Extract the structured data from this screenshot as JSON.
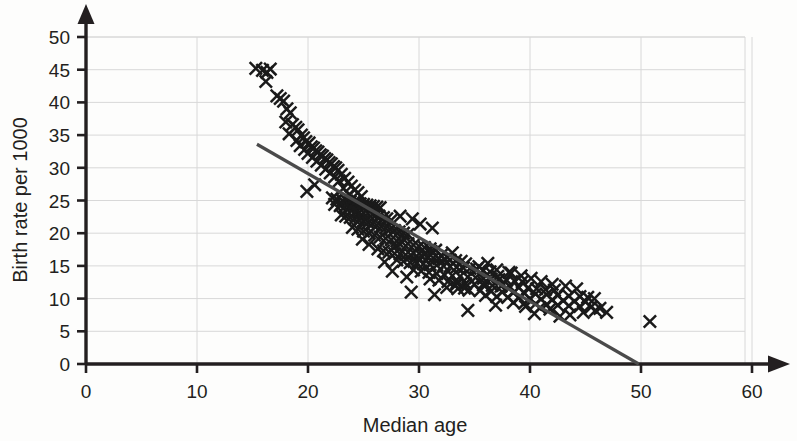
{
  "chart_data": {
    "type": "scatter",
    "title": "",
    "xlabel": "Median age",
    "ylabel": "Birth rate per 1000",
    "xlim": [
      0,
      60
    ],
    "ylim": [
      0,
      50
    ],
    "xticks": [
      0,
      10,
      20,
      30,
      40,
      50,
      60
    ],
    "yticks": [
      0,
      5,
      10,
      15,
      20,
      25,
      30,
      35,
      40,
      45,
      50
    ],
    "grid": "both",
    "grid_color": "#d8d8d8",
    "marker": "x-cross",
    "marker_color": "#1a1a1a",
    "axis_color": "#231f20",
    "background": "#fdfdfc",
    "legend": "none",
    "trend_line": {
      "label": "line of best fit",
      "color": "#4a4a4a",
      "x_start": 15.4,
      "y_start": 33.6,
      "x_end": 49.8,
      "y_end": 0.0
    },
    "points": [
      [
        15.3,
        45.2
      ],
      [
        15.9,
        44.9
      ],
      [
        16.3,
        44.6
      ],
      [
        16.6,
        45.1
      ],
      [
        16.2,
        43.2
      ],
      [
        17.2,
        41.0
      ],
      [
        17.5,
        40.6
      ],
      [
        17.8,
        40.2
      ],
      [
        18.1,
        39.0
      ],
      [
        18.4,
        38.4
      ],
      [
        18.0,
        37.0
      ],
      [
        18.6,
        36.6
      ],
      [
        18.9,
        36.2
      ],
      [
        19.1,
        35.8
      ],
      [
        18.3,
        35.2
      ],
      [
        19.4,
        35.0
      ],
      [
        19.6,
        34.6
      ],
      [
        19.0,
        34.2
      ],
      [
        19.8,
        34.0
      ],
      [
        20.1,
        33.8
      ],
      [
        19.3,
        33.4
      ],
      [
        20.3,
        33.2
      ],
      [
        20.5,
        33.0
      ],
      [
        19.7,
        32.8
      ],
      [
        20.7,
        32.6
      ],
      [
        20.9,
        32.4
      ],
      [
        20.0,
        32.2
      ],
      [
        21.1,
        32.0
      ],
      [
        21.3,
        31.8
      ],
      [
        20.4,
        31.6
      ],
      [
        21.5,
        31.4
      ],
      [
        21.7,
        31.2
      ],
      [
        20.8,
        31.0
      ],
      [
        21.9,
        30.8
      ],
      [
        22.1,
        30.6
      ],
      [
        21.2,
        30.4
      ],
      [
        22.3,
        30.2
      ],
      [
        22.5,
        30.0
      ],
      [
        21.6,
        29.8
      ],
      [
        22.7,
        29.6
      ],
      [
        22.0,
        29.2
      ],
      [
        23.0,
        29.0
      ],
      [
        22.4,
        28.6
      ],
      [
        23.3,
        28.4
      ],
      [
        22.8,
        28.0
      ],
      [
        23.6,
        27.8
      ],
      [
        20.6,
        27.4
      ],
      [
        23.9,
        27.2
      ],
      [
        23.2,
        26.9
      ],
      [
        19.9,
        26.4
      ],
      [
        24.2,
        26.6
      ],
      [
        24.5,
        26.2
      ],
      [
        23.7,
        25.9
      ],
      [
        24.8,
        25.6
      ],
      [
        22.2,
        25.4
      ],
      [
        22.6,
        25.2
      ],
      [
        23.1,
        25.0
      ],
      [
        23.5,
        24.9
      ],
      [
        23.8,
        24.8
      ],
      [
        24.1,
        24.7
      ],
      [
        24.4,
        24.6
      ],
      [
        24.7,
        24.5
      ],
      [
        25.0,
        24.4
      ],
      [
        25.3,
        24.3
      ],
      [
        25.6,
        24.2
      ],
      [
        25.9,
        24.1
      ],
      [
        26.2,
        24.0
      ],
      [
        26.5,
        23.9
      ],
      [
        22.4,
        24.4
      ],
      [
        22.9,
        24.2
      ],
      [
        23.3,
        24.0
      ],
      [
        23.7,
        23.8
      ],
      [
        24.0,
        23.6
      ],
      [
        24.3,
        23.4
      ],
      [
        24.6,
        23.2
      ],
      [
        25.0,
        23.1
      ],
      [
        25.4,
        23.0
      ],
      [
        25.8,
        22.9
      ],
      [
        26.1,
        22.8
      ],
      [
        26.4,
        22.6
      ],
      [
        26.8,
        22.4
      ],
      [
        27.1,
        22.2
      ],
      [
        27.5,
        22.0
      ],
      [
        23.0,
        22.8
      ],
      [
        23.4,
        22.6
      ],
      [
        23.8,
        22.4
      ],
      [
        24.2,
        22.2
      ],
      [
        24.6,
        22.0
      ],
      [
        25.0,
        21.8
      ],
      [
        25.4,
        21.6
      ],
      [
        25.8,
        21.4
      ],
      [
        26.2,
        21.2
      ],
      [
        26.6,
        21.0
      ],
      [
        27.0,
        20.8
      ],
      [
        27.4,
        20.6
      ],
      [
        27.8,
        20.4
      ],
      [
        28.2,
        20.2
      ],
      [
        28.6,
        20.0
      ],
      [
        29.0,
        19.8
      ],
      [
        24.0,
        20.9
      ],
      [
        24.5,
        20.6
      ],
      [
        25.0,
        20.3
      ],
      [
        25.5,
        20.0
      ],
      [
        26.0,
        19.7
      ],
      [
        26.5,
        19.4
      ],
      [
        27.0,
        19.2
      ],
      [
        27.5,
        19.0
      ],
      [
        28.0,
        18.8
      ],
      [
        28.5,
        18.6
      ],
      [
        29.0,
        18.4
      ],
      [
        29.5,
        18.2
      ],
      [
        30.0,
        18.0
      ],
      [
        30.5,
        17.8
      ],
      [
        31.0,
        17.6
      ],
      [
        31.5,
        17.4
      ],
      [
        28.3,
        22.6
      ],
      [
        29.4,
        22.2
      ],
      [
        30.1,
        21.4
      ],
      [
        31.2,
        20.8
      ],
      [
        26.8,
        17.3
      ],
      [
        27.3,
        17.1
      ],
      [
        27.8,
        16.9
      ],
      [
        28.3,
        16.8
      ],
      [
        28.8,
        16.7
      ],
      [
        29.3,
        16.6
      ],
      [
        29.8,
        16.5
      ],
      [
        30.3,
        16.4
      ],
      [
        30.8,
        16.3
      ],
      [
        31.3,
        16.2
      ],
      [
        31.8,
        16.1
      ],
      [
        32.3,
        16.0
      ],
      [
        32.8,
        15.9
      ],
      [
        33.3,
        15.8
      ],
      [
        33.8,
        15.7
      ],
      [
        28.0,
        15.9
      ],
      [
        28.6,
        15.7
      ],
      [
        29.2,
        15.5
      ],
      [
        29.8,
        15.4
      ],
      [
        30.4,
        15.3
      ],
      [
        31.0,
        15.2
      ],
      [
        31.6,
        15.1
      ],
      [
        32.2,
        15.0
      ],
      [
        32.8,
        14.9
      ],
      [
        33.4,
        14.8
      ],
      [
        34.0,
        14.7
      ],
      [
        34.6,
        14.6
      ],
      [
        35.2,
        14.5
      ],
      [
        35.8,
        14.3
      ],
      [
        36.4,
        14.1
      ],
      [
        29.5,
        14.4
      ],
      [
        30.2,
        14.2
      ],
      [
        30.9,
        14.0
      ],
      [
        31.6,
        13.8
      ],
      [
        32.3,
        13.6
      ],
      [
        33.0,
        13.5
      ],
      [
        33.7,
        13.4
      ],
      [
        34.4,
        13.3
      ],
      [
        35.1,
        13.2
      ],
      [
        35.8,
        13.1
      ],
      [
        36.5,
        13.0
      ],
      [
        37.2,
        12.9
      ],
      [
        37.9,
        12.8
      ],
      [
        38.6,
        12.7
      ],
      [
        39.3,
        12.6
      ],
      [
        31.0,
        13.0
      ],
      [
        31.8,
        12.8
      ],
      [
        32.6,
        12.6
      ],
      [
        33.4,
        12.4
      ],
      [
        34.2,
        12.3
      ],
      [
        35.0,
        12.2
      ],
      [
        35.8,
        12.1
      ],
      [
        36.6,
        12.0
      ],
      [
        37.4,
        11.9
      ],
      [
        38.2,
        11.8
      ],
      [
        39.0,
        11.7
      ],
      [
        39.8,
        11.6
      ],
      [
        40.6,
        11.5
      ],
      [
        41.4,
        11.4
      ],
      [
        42.2,
        11.3
      ],
      [
        32.5,
        11.7
      ],
      [
        33.5,
        11.5
      ],
      [
        34.5,
        11.3
      ],
      [
        35.5,
        11.2
      ],
      [
        36.5,
        11.1
      ],
      [
        37.5,
        11.0
      ],
      [
        38.5,
        10.9
      ],
      [
        39.5,
        10.8
      ],
      [
        40.5,
        10.7
      ],
      [
        41.5,
        10.6
      ],
      [
        42.5,
        10.5
      ],
      [
        43.5,
        10.4
      ],
      [
        44.5,
        10.3
      ],
      [
        45.2,
        10.2
      ],
      [
        45.8,
        10.0
      ],
      [
        36.0,
        10.5
      ],
      [
        37.0,
        10.3
      ],
      [
        38.0,
        10.2
      ],
      [
        39.0,
        10.1
      ],
      [
        40.0,
        10.0
      ],
      [
        41.0,
        9.9
      ],
      [
        42.0,
        9.8
      ],
      [
        43.0,
        9.7
      ],
      [
        44.0,
        9.6
      ],
      [
        45.0,
        9.5
      ],
      [
        38.5,
        9.4
      ],
      [
        39.5,
        9.3
      ],
      [
        40.5,
        9.2
      ],
      [
        41.5,
        9.1
      ],
      [
        42.5,
        9.0
      ],
      [
        43.5,
        8.9
      ],
      [
        44.5,
        8.8
      ],
      [
        45.5,
        8.7
      ],
      [
        46.3,
        8.5
      ],
      [
        46.9,
        7.9
      ],
      [
        33.3,
        12.0
      ],
      [
        34.1,
        11.6
      ],
      [
        35.9,
        12.4
      ],
      [
        37.1,
        13.4
      ],
      [
        38.3,
        13.9
      ],
      [
        30.5,
        16.9
      ],
      [
        31.1,
        17.2
      ],
      [
        32.0,
        16.6
      ],
      [
        33.0,
        17.0
      ],
      [
        34.2,
        15.3
      ],
      [
        35.4,
        14.9
      ],
      [
        36.2,
        15.4
      ],
      [
        37.0,
        14.4
      ],
      [
        38.1,
        14.0
      ],
      [
        39.2,
        13.5
      ],
      [
        40.1,
        13.1
      ],
      [
        41.0,
        12.6
      ],
      [
        42.0,
        12.2
      ],
      [
        43.2,
        11.9
      ],
      [
        44.2,
        11.5
      ],
      [
        29.3,
        11.0
      ],
      [
        31.4,
        10.6
      ],
      [
        34.4,
        8.2
      ],
      [
        40.4,
        7.7
      ],
      [
        42.7,
        7.3
      ],
      [
        43.6,
        7.5
      ],
      [
        44.8,
        7.9
      ],
      [
        45.9,
        8.2
      ],
      [
        40.9,
        8.6
      ],
      [
        41.8,
        8.4
      ],
      [
        36.9,
        9.0
      ],
      [
        39.6,
        8.8
      ],
      [
        28.9,
        13.3
      ],
      [
        27.6,
        14.2
      ],
      [
        26.9,
        15.6
      ],
      [
        25.5,
        18.3
      ],
      [
        26.3,
        17.6
      ],
      [
        24.9,
        19.1
      ],
      [
        27.9,
        18.0
      ],
      [
        29.9,
        16.1
      ],
      [
        50.8,
        6.5
      ]
    ]
  },
  "axis": {
    "x_ticks": [
      "0",
      "10",
      "20",
      "30",
      "40",
      "50",
      "60"
    ],
    "y_ticks": [
      "0",
      "5",
      "10",
      "15",
      "20",
      "25",
      "30",
      "35",
      "40",
      "45",
      "50"
    ],
    "x_title": "Median age",
    "y_title": "Birth rate per 1000"
  }
}
